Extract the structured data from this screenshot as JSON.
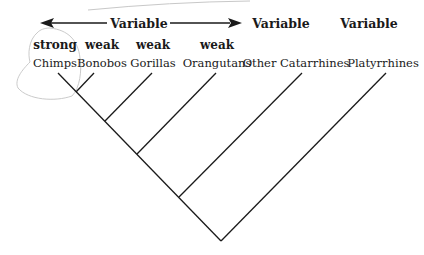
{
  "diagram": {
    "type": "cladogram",
    "range_arrow": {
      "label": "Variable",
      "direction": "bidirectional"
    },
    "headers": [
      {
        "label": "Variable",
        "over": "Other Catarrhines"
      },
      {
        "label": "Variable",
        "over": "Platyrrhines"
      }
    ],
    "taxa": [
      {
        "name": "Chimps",
        "strength": "strong",
        "circled": true
      },
      {
        "name": "Bonobos",
        "strength": "weak"
      },
      {
        "name": "Gorillas",
        "strength": "weak"
      },
      {
        "name": "Orangutans",
        "strength": "weak"
      },
      {
        "name": "Other Catarrhines",
        "strength": ""
      },
      {
        "name": "Platyrrhines",
        "strength": ""
      }
    ],
    "colors": {
      "line": "#1a1a1a",
      "annotation": "#bdbdbd"
    }
  }
}
